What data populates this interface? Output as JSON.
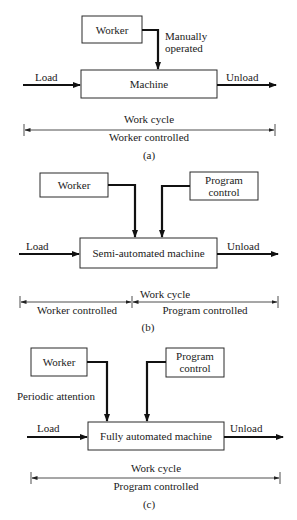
{
  "panels": [
    {
      "id": "a",
      "caption": "(a)",
      "worker_label": "Worker",
      "input_note_line1": "Manually",
      "input_note_line2": "operated",
      "machine_label": "Machine",
      "load_label": "Load",
      "unload_label": "Unload",
      "cycle_label": "Work cycle",
      "control_label": "Worker controlled"
    },
    {
      "id": "b",
      "caption": "(b)",
      "worker_label": "Worker",
      "program_line1": "Program",
      "program_line2": "control",
      "machine_label": "Semi-automated machine",
      "load_label": "Load",
      "unload_label": "Unload",
      "cycle_label": "Work cycle",
      "worker_segment_label": "Worker controlled",
      "program_segment_label": "Program controlled"
    },
    {
      "id": "c",
      "caption": "(c)",
      "worker_label": "Worker",
      "attention_label": "Periodic attention",
      "program_line1": "Program",
      "program_line2": "control",
      "machine_label": "Fully automated machine",
      "load_label": "Load",
      "unload_label": "Unload",
      "cycle_label": "Work cycle",
      "control_label": "Program controlled"
    }
  ]
}
